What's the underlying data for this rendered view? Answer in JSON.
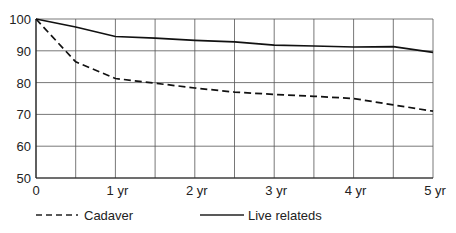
{
  "chart_data": {
    "type": "line",
    "title": "",
    "xlabel": "",
    "ylabel": "",
    "x": [
      0,
      0.5,
      1,
      1.5,
      2,
      2.5,
      3,
      3.5,
      4,
      4.5,
      5
    ],
    "x_tick_labels": [
      "0",
      "1 yr",
      "2 yr",
      "3 yr",
      "4 yr",
      "5 yr"
    ],
    "x_ticks": [
      0,
      1,
      2,
      3,
      4,
      5
    ],
    "y_tick_labels": [
      "100",
      "90",
      "80",
      "70",
      "60",
      "50"
    ],
    "y_ticks": [
      100,
      90,
      80,
      70,
      60,
      50
    ],
    "xlim": [
      0,
      5
    ],
    "ylim": [
      50,
      100
    ],
    "grid": true,
    "legend_position": "bottom",
    "series": [
      {
        "name": "Cadaver",
        "style": "dashed",
        "values": [
          100,
          86.5,
          81.3,
          79.8,
          78.3,
          77,
          76.3,
          75.7,
          75,
          73,
          71
        ]
      },
      {
        "name": "Live relateds",
        "style": "solid",
        "values": [
          100,
          97.5,
          94.5,
          94,
          93.3,
          92.8,
          91.8,
          91.5,
          91.2,
          91.3,
          89.5
        ]
      }
    ]
  },
  "legend": {
    "cadaver": "Cadaver",
    "live": "Live relateds"
  }
}
